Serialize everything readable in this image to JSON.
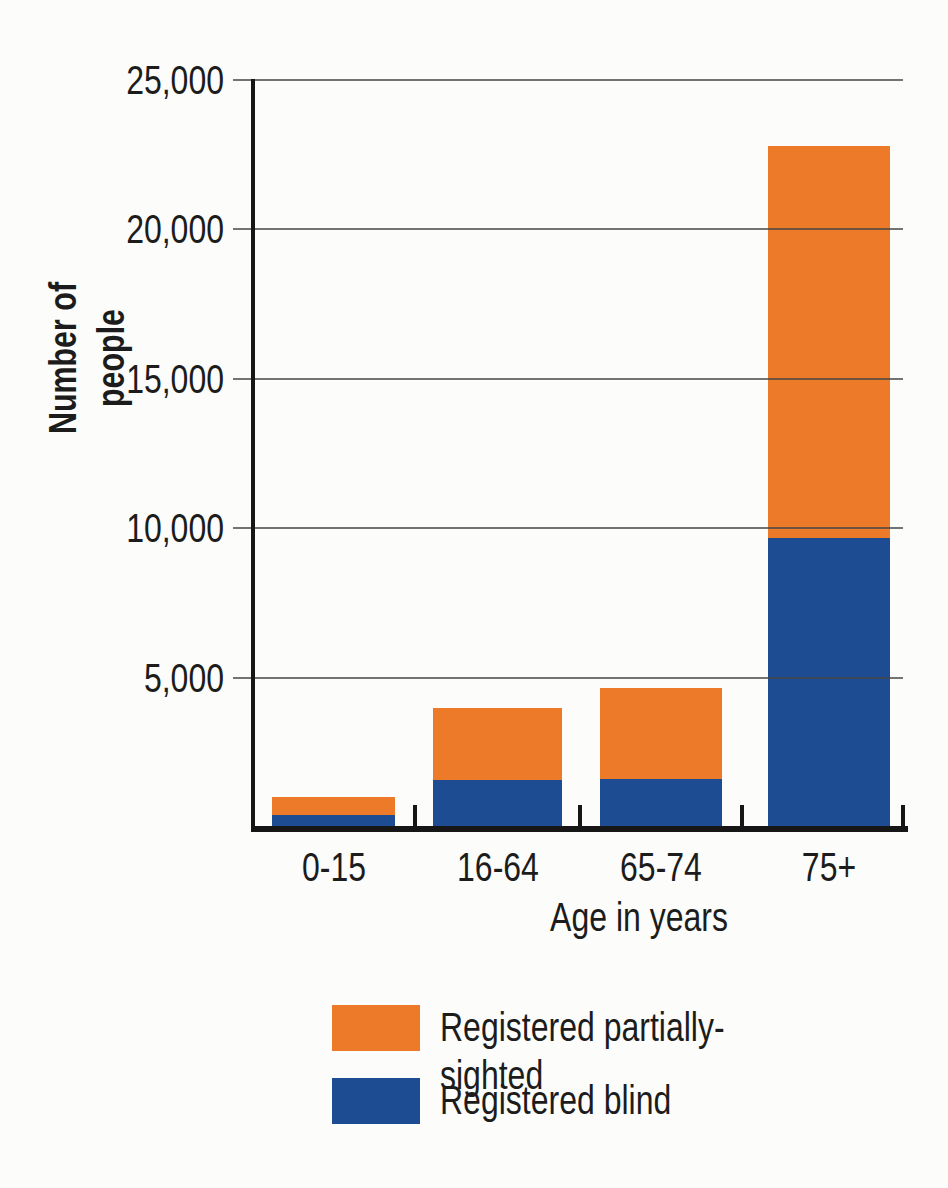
{
  "colors": {
    "partially_sighted": "#EC7A28",
    "blind": "#1E4C92",
    "axis": "#161616",
    "grid": "#464646",
    "text": "#1c1c1c",
    "background": "#fcfcfa"
  },
  "chart_data": {
    "type": "bar",
    "stacked": true,
    "title": "",
    "xlabel": "Age in years",
    "ylabel": "Number of people",
    "categories": [
      "0-15",
      "16-64",
      "65-74",
      "75+"
    ],
    "series": [
      {
        "name": "Registered blind",
        "color_key": "blind",
        "values": [
          450,
          1600,
          1650,
          9700
        ]
      },
      {
        "name": "Registered partially-sighted",
        "color_key": "partially_sighted",
        "values": [
          600,
          2400,
          3050,
          13100
        ]
      }
    ],
    "stack_totals": [
      1050,
      4000,
      4700,
      22800
    ],
    "ylim": [
      0,
      25000
    ],
    "yticks": [
      5000,
      10000,
      15000,
      20000,
      25000
    ],
    "ytick_labels": [
      "5,000",
      "10,000",
      "15,000",
      "20,000",
      "25,000"
    ],
    "grid": "horizontal-only",
    "legend_position": "bottom",
    "legend_items": [
      {
        "label": "Registered partially-sighted",
        "color_key": "partially_sighted"
      },
      {
        "label": "Registered blind",
        "color_key": "blind"
      }
    ]
  }
}
